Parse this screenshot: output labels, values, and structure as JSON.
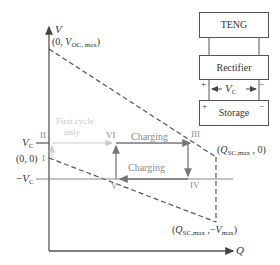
{
  "axes": {
    "y_label": "V",
    "x_label": "Q"
  },
  "points": {
    "voc_max": {
      "pre": "(0, ",
      "sym": "V",
      "sub": "OC, max",
      "post": ")"
    },
    "origin": "(0, 0)",
    "qsc_zero": {
      "pre": "(",
      "sym": "Q",
      "sub": "SC,max",
      "post": " , 0)"
    },
    "qsc_vmax": {
      "pre": "(",
      "sym": "Q",
      "sub": "SC,max",
      "mid": " ,−",
      "sym2": "V",
      "sub2": "max",
      "post": ")"
    }
  },
  "levels": {
    "vc_sym": "V",
    "vc_sub": "C",
    "neg_vc_pre": "−",
    "neg_vc_sym": "V",
    "neg_vc_sub": "C"
  },
  "states": {
    "I": "I",
    "II": "II",
    "III": "III",
    "IV": "IV",
    "V": "V",
    "VI": "VI"
  },
  "annotations": {
    "first_cycle_line1": "First cycle",
    "first_cycle_line2": "only",
    "charging_upper": "Charging",
    "charging_lower": "Charging"
  },
  "circuit": {
    "teng": "TENG",
    "rectifier": "Rectifier",
    "storage": "Storage",
    "plus": "+",
    "minus": "−",
    "vc_sym": "V",
    "vc_sub": "C"
  },
  "colors": {
    "axis": "#555555",
    "dashed": "#555555",
    "path": "#888888",
    "faint": "#cccccc"
  }
}
